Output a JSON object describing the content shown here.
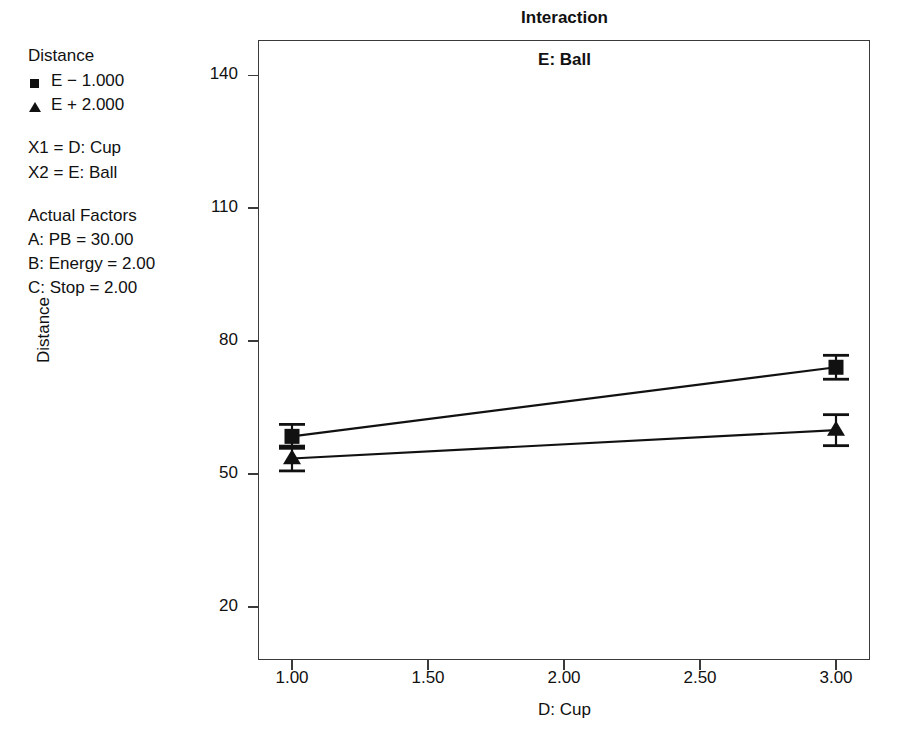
{
  "chart_data": {
    "type": "line",
    "title": "Interaction",
    "panel_label": "E: Ball",
    "xlabel": "D: Cup",
    "ylabel": "Distance",
    "x": [
      1.0,
      3.0
    ],
    "xlim": [
      0.875,
      3.125
    ],
    "ylim": [
      8.0,
      148.0
    ],
    "xticks": [
      "1.00",
      "1.50",
      "2.00",
      "2.50",
      "3.00"
    ],
    "xtick_values": [
      1.0,
      1.5,
      2.0,
      2.5,
      3.0
    ],
    "yticks": [
      "20",
      "50",
      "80",
      "110",
      "140"
    ],
    "ytick_values": [
      20,
      50,
      80,
      110,
      140
    ],
    "grid": false,
    "legend_position": "outside-left",
    "series": [
      {
        "name": "E − 1.000",
        "marker": "square",
        "values": [
          58.5,
          74.1
        ],
        "errors": [
          2.7,
          2.7
        ]
      },
      {
        "name": "E + 2.000",
        "marker": "triangle",
        "values": [
          53.5,
          59.9
        ],
        "errors": [
          2.8,
          3.5
        ]
      }
    ]
  },
  "legend": {
    "title": "Distance",
    "entries": [
      {
        "marker": "square",
        "label": "E − 1.000"
      },
      {
        "marker": "triangle",
        "label": "E + 2.000"
      }
    ],
    "axis_mapping": [
      "X1 = D: Cup",
      "X2 = E: Ball"
    ],
    "actual_factors_title": "Actual Factors",
    "actual_factors": [
      "A: PB = 30.00",
      "B: Energy = 2.00",
      "C: Stop = 2.00"
    ]
  },
  "colors": {
    "ink": "#111111",
    "frame": "#3a3a3a",
    "background": "#ffffff"
  }
}
